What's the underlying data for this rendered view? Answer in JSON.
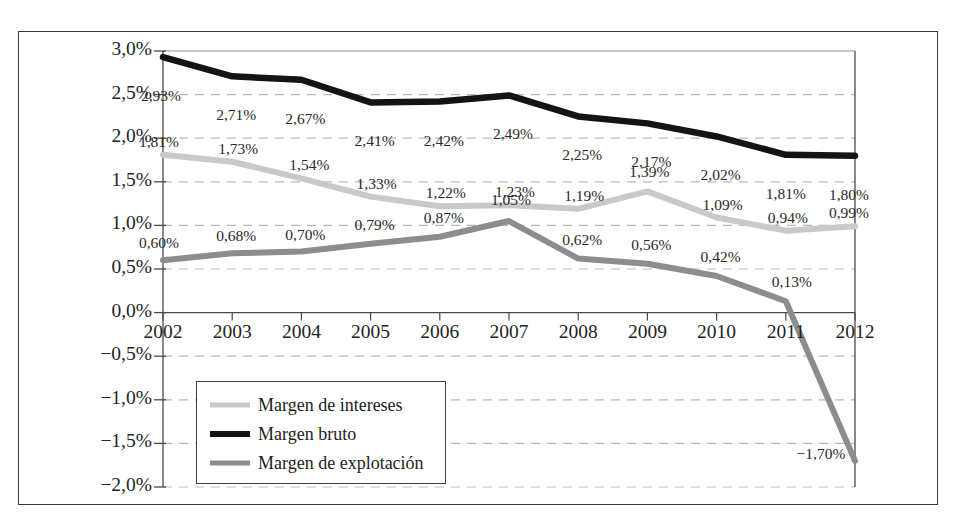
{
  "chart_data": {
    "type": "line",
    "title": "",
    "subtitle": "",
    "xlabel": "",
    "ylabel": "",
    "categories": [
      "2002",
      "2003",
      "2004",
      "2005",
      "2006",
      "2007",
      "2008",
      "2009",
      "2010",
      "2011",
      "2012"
    ],
    "x": [
      2002,
      2003,
      2004,
      2005,
      2006,
      2007,
      2008,
      2009,
      2010,
      2011,
      2012
    ],
    "ylim": [
      -2.0,
      3.0
    ],
    "yticks": [
      3.0,
      2.5,
      2.0,
      1.5,
      1.0,
      0.5,
      0.0,
      -0.5,
      -1.0,
      -1.5,
      -2.0
    ],
    "ytick_labels": [
      "3,0%",
      "2,5%",
      "2,0%",
      "1,5%",
      "1,0%",
      "0,5%",
      "0,0%",
      "−0,5%",
      "−1,0%",
      "−1,5%",
      "−2,0%"
    ],
    "xtick_labels": [
      "2002",
      "2003",
      "2004",
      "2005",
      "2006",
      "2007",
      "2008",
      "2009",
      "2010",
      "2011",
      "2012"
    ],
    "grid": true,
    "grid_style": "dashed-horizontal",
    "legend_position": "bottom-left",
    "value_labels": true,
    "decimal_separator": ",",
    "unit": "%",
    "series": [
      {
        "name": "Margen de intereses",
        "color": "#c9c9c9",
        "values": [
          1.81,
          1.73,
          1.54,
          1.33,
          1.22,
          1.23,
          1.19,
          1.39,
          1.09,
          0.94,
          0.99
        ],
        "labels": [
          "1,81%",
          "1,73%",
          "1,54%",
          "1,33%",
          "1,22%",
          "1,23%",
          "1,19%",
          "1,39%",
          "1,09%",
          "0,94%",
          "0,99%"
        ]
      },
      {
        "name": "Margen bruto",
        "color": "#141414",
        "values": [
          2.93,
          2.71,
          2.67,
          2.41,
          2.42,
          2.49,
          2.25,
          2.17,
          2.02,
          1.81,
          1.8
        ],
        "labels": [
          "2,93%",
          "2,71%",
          "2,67%",
          "2,41%",
          "2,42%",
          "2,49%",
          "2,25%",
          "2,17%",
          "2,02%",
          "1,81%",
          "1,80%"
        ]
      },
      {
        "name": "Margen de explotación",
        "color": "#8d8d8d",
        "values": [
          0.6,
          0.68,
          0.7,
          0.79,
          0.87,
          1.05,
          0.62,
          0.56,
          0.42,
          0.13,
          -1.7
        ],
        "labels": [
          "0,60%",
          "0,68%",
          "0,70%",
          "0,79%",
          "0,87%",
          "1,05%",
          "0,62%",
          "0,56%",
          "0,42%",
          "0,13%",
          "−1,70%"
        ]
      }
    ]
  },
  "legend": {
    "items": [
      {
        "label": "Margen de intereses",
        "color": "#c9c9c9",
        "thickness": 5
      },
      {
        "label": "Margen bruto",
        "color": "#141414",
        "thickness": 6
      },
      {
        "label": "Margen de explotación",
        "color": "#8d8d8d",
        "thickness": 5
      }
    ]
  },
  "colors": {
    "frame": "#3a3a3a",
    "axis": "#4a4a4a",
    "gridline": "#b9b9b9",
    "background": "#ffffff",
    "text": "#232323"
  }
}
